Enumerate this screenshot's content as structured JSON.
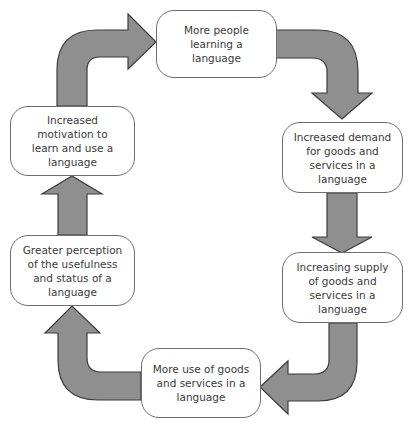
{
  "diagram": {
    "type": "cycle",
    "colors": {
      "arrow_fill": "#8f8f8f",
      "arrow_stroke": "#3d3d3d",
      "box_border": "#6e6e6e",
      "text": "#3a3a3a"
    },
    "nodes": [
      {
        "id": "n1",
        "label": "More people\nlearning a\nlanguage"
      },
      {
        "id": "n2",
        "label": "Increased demand\nfor goods and\nservices in a\nlanguage"
      },
      {
        "id": "n3",
        "label": "Increasing supply\nof goods and\nservices in a\nlanguage"
      },
      {
        "id": "n4",
        "label": "More use of goods\nand services in a\nlanguage"
      },
      {
        "id": "n5",
        "label": "Greater perception\nof the usefulness\nand status of a\nlanguage"
      },
      {
        "id": "n6",
        "label": "Increased\nmotivation to\nlearn and use a\nlanguage"
      }
    ],
    "edges": [
      {
        "from": "n1",
        "to": "n2"
      },
      {
        "from": "n2",
        "to": "n3"
      },
      {
        "from": "n3",
        "to": "n4"
      },
      {
        "from": "n4",
        "to": "n5"
      },
      {
        "from": "n5",
        "to": "n6"
      },
      {
        "from": "n6",
        "to": "n1"
      }
    ]
  }
}
